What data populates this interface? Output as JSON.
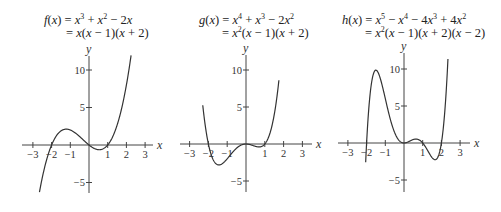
{
  "chart_data": [
    {
      "type": "line",
      "title": "f(x) = x^3 + x^2 - 2x = x(x - 1)(x + 2)",
      "formula_line1": [
        "f(x) = x",
        "3",
        " + x",
        "2",
        " − 2x"
      ],
      "formula_line2": "= x(x − 1)(x + 2)",
      "coefficients_desc": [
        1,
        1,
        -2,
        0
      ],
      "xlabel": "x",
      "ylabel": "y",
      "xlim": [
        -3.5,
        3.5
      ],
      "ylim": [
        -6.5,
        12
      ],
      "x_ticks": [
        -3,
        -2,
        -1,
        1,
        2,
        3
      ],
      "x_tick_labels": [
        "−3",
        "−2",
        "−1",
        "1",
        "2",
        "3"
      ],
      "y_ticks": [
        10,
        5,
        -5
      ],
      "y_tick_labels": [
        "10",
        "5",
        "−5"
      ],
      "roots": [
        -2,
        0,
        1
      ],
      "plot_domain": [
        -2.65,
        2.25
      ],
      "grid": false,
      "layout": {
        "origin_x": 89,
        "origin_y": 145,
        "px_per_x": 18.7,
        "px_per_y": 7.5,
        "axis_x_from": 22,
        "axis_x_to": 153,
        "axis_y_from": 56,
        "axis_y_to": 193,
        "formula_left": 44,
        "formula_top": 14
      }
    },
    {
      "type": "line",
      "title": "g(x) = x^4 + x^3 - 2x^2 = x^2(x - 1)(x + 2)",
      "formula_line1": [
        "g(x) = x",
        "4",
        " + x",
        "3",
        " − 2x",
        "2"
      ],
      "formula_line2": "= x",
      "formula_line2_sup": "2",
      "formula_line2_rest": "(x − 1)(x + 2)",
      "coefficients_desc": [
        1,
        1,
        -2,
        0,
        0
      ],
      "xlabel": "x",
      "ylabel": "y",
      "xlim": [
        -3.5,
        3.5
      ],
      "ylim": [
        -6.5,
        12
      ],
      "x_ticks": [
        -3,
        -2,
        -1,
        1,
        2,
        3
      ],
      "x_tick_labels": [
        "−3",
        "−2",
        "−1",
        "1",
        "2",
        "3"
      ],
      "y_ticks": [
        10,
        5,
        -5
      ],
      "y_tick_labels": [
        "10",
        "5",
        "−5"
      ],
      "roots": [
        -2,
        0,
        1
      ],
      "plot_domain": [
        -2.3,
        1.75
      ],
      "grid": false,
      "layout": {
        "origin_x": 246,
        "origin_y": 144,
        "px_per_x": 18.8,
        "px_per_y": 7.4,
        "axis_x_from": 180,
        "axis_x_to": 312,
        "axis_y_from": 55,
        "axis_y_to": 192,
        "formula_left": 199,
        "formula_top": 14
      }
    },
    {
      "type": "line",
      "title": "h(x) = x^5 - x^4 - 4x^3 + 4x^2 = x^2(x - 1)(x + 2)(x - 2)",
      "formula_line1": [
        "h(x) = x",
        "5",
        " − x",
        "4",
        " − 4x",
        "3",
        " + 4x",
        "2"
      ],
      "formula_line2": "= x",
      "formula_line2_sup": "2",
      "formula_line2_rest": "(x − 1)(x + 2)(x − 2)",
      "coefficients_desc": [
        1,
        -1,
        -4,
        4,
        0,
        0
      ],
      "xlabel": "x",
      "ylabel": "y",
      "xlim": [
        -3.5,
        3.5
      ],
      "ylim": [
        -6.5,
        12
      ],
      "x_ticks": [
        -3,
        -2,
        -1,
        1,
        2,
        3
      ],
      "x_tick_labels": [
        "−3",
        "−2",
        "−1",
        "1",
        "2",
        "3"
      ],
      "y_ticks": [
        10,
        5,
        -5
      ],
      "y_tick_labels": [
        "10",
        "5",
        "−5"
      ],
      "roots": [
        -2,
        0,
        1,
        2
      ],
      "plot_domain": [
        -2.05,
        2.35
      ],
      "grid": false,
      "layout": {
        "origin_x": 404,
        "origin_y": 143,
        "px_per_x": 18.7,
        "px_per_y": 7.4,
        "axis_x_from": 338,
        "axis_x_to": 470,
        "axis_y_from": 53,
        "axis_y_to": 192,
        "formula_left": 342,
        "formula_top": 14
      }
    }
  ],
  "style": {
    "curve_color": "#333333",
    "axis_color": "#444444"
  }
}
